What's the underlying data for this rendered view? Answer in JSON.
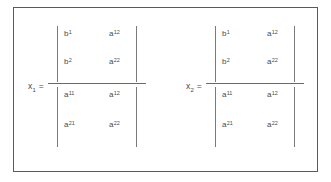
{
  "figure": {
    "frame_color": "#5a5a5a",
    "background_color": "#ffffff",
    "text_color": "#4a4a4a",
    "rule_color": "#6a6a6a"
  },
  "equations": [
    {
      "name": "x1",
      "variable": "x",
      "variable_subscript": "1",
      "equals": "=",
      "numerator": {
        "rows": [
          [
            {
              "base": "b",
              "sub": "1"
            },
            {
              "base": "a",
              "sub": "12"
            }
          ],
          [
            {
              "base": "b",
              "sub": "2"
            },
            {
              "base": "a",
              "sub": "22"
            }
          ]
        ]
      },
      "denominator": {
        "rows": [
          [
            {
              "base": "a",
              "sub": "11"
            },
            {
              "base": "a",
              "sub": "12"
            }
          ],
          [
            {
              "base": "a",
              "sub": "21"
            },
            {
              "base": "a",
              "sub": "22"
            }
          ]
        ]
      }
    },
    {
      "name": "x2",
      "variable": "x",
      "variable_subscript": "2",
      "equals": "=",
      "numerator": {
        "rows": [
          [
            {
              "base": "b",
              "sub": "1"
            },
            {
              "base": "a",
              "sub": "12"
            }
          ],
          [
            {
              "base": "b",
              "sub": "2"
            },
            {
              "base": "a",
              "sub": "22"
            }
          ]
        ]
      },
      "denominator": {
        "rows": [
          [
            {
              "base": "a",
              "sub": "11"
            },
            {
              "base": "a",
              "sub": "12"
            }
          ],
          [
            {
              "base": "a",
              "sub": "21"
            },
            {
              "base": "a",
              "sub": "22"
            }
          ]
        ]
      }
    }
  ]
}
